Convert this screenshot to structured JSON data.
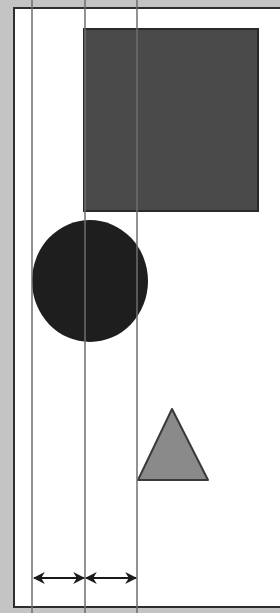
{
  "diagram": {
    "title": "",
    "colors": {
      "frame": "#c4c4c4",
      "canvas": "#ffffff",
      "border": "#2e2e2e",
      "guide_line": "#6e6e6e",
      "square_fill": "#4a4a4a",
      "square_stroke": "#2a2a2a",
      "circle_fill": "#1e1e1e",
      "triangle_fill": "#8a8a8a",
      "triangle_stroke": "#3a3a3a",
      "arrow": "#1a1a1a"
    },
    "guides": [
      {
        "name": "guide-line-left",
        "x": 32
      },
      {
        "name": "guide-line-center",
        "x": 85
      },
      {
        "name": "guide-line-right",
        "x": 137
      }
    ],
    "shapes": [
      {
        "type": "square",
        "name": "square-shape",
        "x": 84,
        "y": 29,
        "width": 174,
        "height": 182
      },
      {
        "type": "circle",
        "name": "circle-shape",
        "cx": 90,
        "cy": 281,
        "rx": 58,
        "ry": 61
      },
      {
        "type": "triangle",
        "name": "triangle-shape",
        "points": [
          [
            172,
            409
          ],
          [
            138,
            480
          ],
          [
            208,
            480
          ]
        ]
      }
    ],
    "spacing_arrows": [
      {
        "name": "spacing-arrow-left",
        "x1": 33,
        "x2": 85,
        "y": 578
      },
      {
        "name": "spacing-arrow-right",
        "x1": 85,
        "x2": 137,
        "y": 578
      }
    ]
  }
}
